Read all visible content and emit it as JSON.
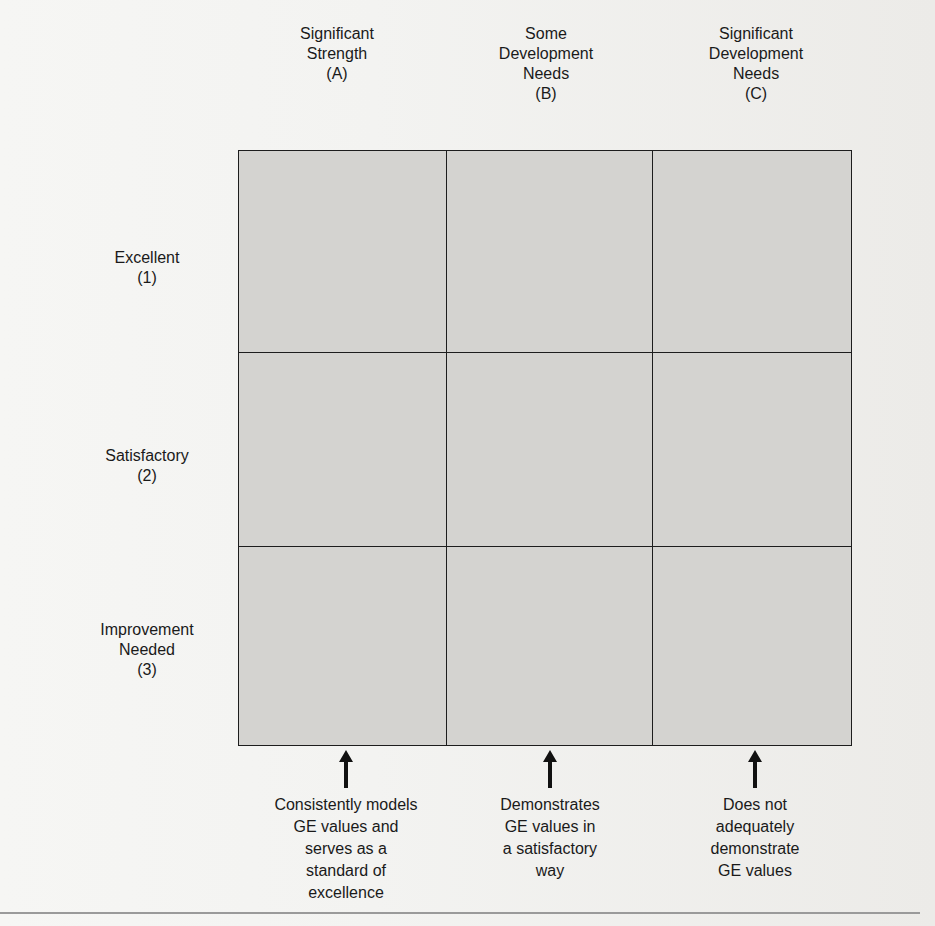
{
  "diagram": {
    "type": "3x3 performance-values matrix",
    "columns": [
      {
        "title": "Significant Strength",
        "code": "(A)",
        "lines": [
          "Significant",
          "Strength",
          "(A)"
        ]
      },
      {
        "title": "Some Development Needs",
        "code": "(B)",
        "lines": [
          "Some",
          "Development",
          "Needs",
          "(B)"
        ]
      },
      {
        "title": "Significant Development Needs",
        "code": "(C)",
        "lines": [
          "Significant",
          "Development",
          "Needs",
          "(C)"
        ]
      }
    ],
    "rows": [
      {
        "title": "Excellent",
        "code": "(1)",
        "lines": [
          "Excellent",
          "(1)"
        ]
      },
      {
        "title": "Satisfactory",
        "code": "(2)",
        "lines": [
          "Satisfactory",
          "(2)"
        ]
      },
      {
        "title": "Improvement Needed",
        "code": "(3)",
        "lines": [
          "Improvement",
          "Needed",
          "(3)"
        ]
      }
    ],
    "descriptions": [
      {
        "lines": [
          "Consistently models",
          "GE values and",
          "serves as a",
          "standard of",
          "excellence"
        ]
      },
      {
        "lines": [
          "Demonstrates",
          "GE values in",
          "a satisfactory",
          "way"
        ]
      },
      {
        "lines": [
          "Does not",
          "adequately",
          "demonstrate",
          "GE values"
        ]
      }
    ],
    "colors": {
      "cell_fill": "#d4d3d0",
      "grid_line": "#1d1d1d",
      "background": "#f3f3f1",
      "arrow": "#111111"
    }
  }
}
